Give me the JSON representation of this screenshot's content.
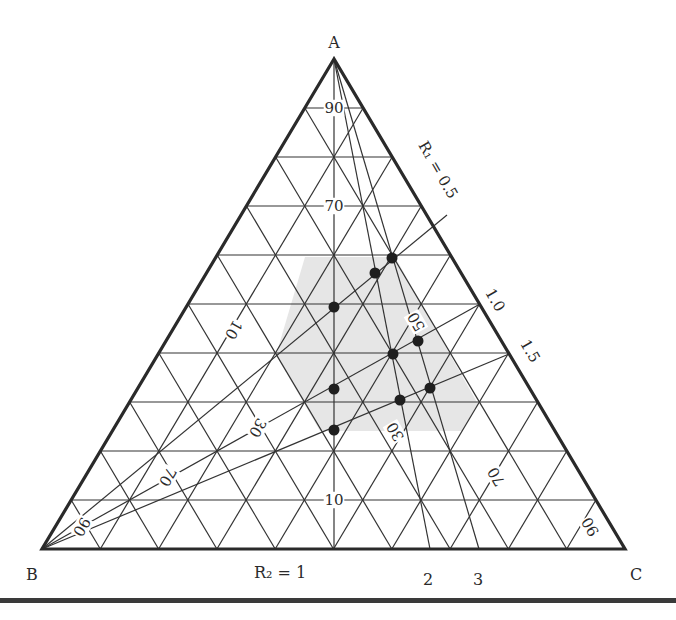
{
  "diagram": {
    "type": "ternary",
    "vertices": {
      "A": {
        "label": "A",
        "x": 334,
        "y": 59
      },
      "B": {
        "label": "B",
        "x": 42,
        "y": 549
      },
      "C": {
        "label": "C",
        "x": 625,
        "y": 549
      }
    },
    "grid_divisions": 10,
    "colors": {
      "line": "#333333",
      "outline": "#2a2a2a",
      "shade": "#e6e6e6",
      "point": "#1f1f1f",
      "background": "#ffffff"
    },
    "axis_labels": {
      "a_scale": [
        {
          "text": "90",
          "x": 334,
          "y": 108
        },
        {
          "text": "70",
          "x": 334,
          "y": 206
        },
        {
          "text": "10",
          "x": 334,
          "y": 500
        }
      ],
      "b_scale": [
        {
          "text": "10",
          "x": 234,
          "y": 330,
          "rotate": 120
        },
        {
          "text": "30",
          "x": 258,
          "y": 428,
          "rotate": 120
        },
        {
          "text": "70",
          "x": 168,
          "y": 477,
          "rotate": 120
        },
        {
          "text": "90",
          "x": 82,
          "y": 527,
          "rotate": 120
        }
      ],
      "c_scale": [
        {
          "text": "50",
          "x": 416,
          "y": 322,
          "rotate": -120
        },
        {
          "text": "30",
          "x": 395,
          "y": 432,
          "rotate": -120
        },
        {
          "text": "70",
          "x": 496,
          "y": 477,
          "rotate": -120
        },
        {
          "text": "90",
          "x": 590,
          "y": 527,
          "rotate": -120
        }
      ]
    },
    "r1_labels": [
      {
        "text": "R₁ = 0.5",
        "x": 438,
        "y": 170,
        "rotate": 60
      },
      {
        "text": "1.0",
        "x": 495,
        "y": 300,
        "rotate": 60
      },
      {
        "text": "1.5",
        "x": 530,
        "y": 351,
        "rotate": 60
      }
    ],
    "r2_labels": [
      {
        "text": "R₂ = 1",
        "x": 280,
        "y": 573
      },
      {
        "text": "2",
        "x": 428,
        "y": 580
      },
      {
        "text": "3",
        "x": 478,
        "y": 580
      }
    ],
    "lines_from_A": [
      {
        "name": "R2 = 1",
        "to": [
          334,
          549
        ]
      },
      {
        "name": "R2 = 2",
        "to": [
          430,
          549
        ]
      },
      {
        "name": "R2 = 3",
        "to": [
          479,
          549
        ]
      }
    ],
    "lines_from_B": [
      {
        "name": "R1 = 0.5",
        "to": [
          447,
          215
        ]
      },
      {
        "name": "R1 = 1.0",
        "to": [
          480,
          304
        ]
      },
      {
        "name": "R1 = 1.5",
        "to": [
          509,
          354
        ]
      }
    ],
    "shaded_region": [
      [
        305,
        257
      ],
      [
        395,
        257
      ],
      [
        478,
        404
      ],
      [
        462,
        431
      ],
      [
        320,
        431
      ],
      [
        276,
        355
      ]
    ],
    "points": [
      {
        "x": 392,
        "y": 258
      },
      {
        "x": 375,
        "y": 273
      },
      {
        "x": 334,
        "y": 307
      },
      {
        "x": 418,
        "y": 341
      },
      {
        "x": 393,
        "y": 354
      },
      {
        "x": 430,
        "y": 388
      },
      {
        "x": 400,
        "y": 400
      },
      {
        "x": 334,
        "y": 389
      },
      {
        "x": 334,
        "y": 430
      }
    ]
  }
}
